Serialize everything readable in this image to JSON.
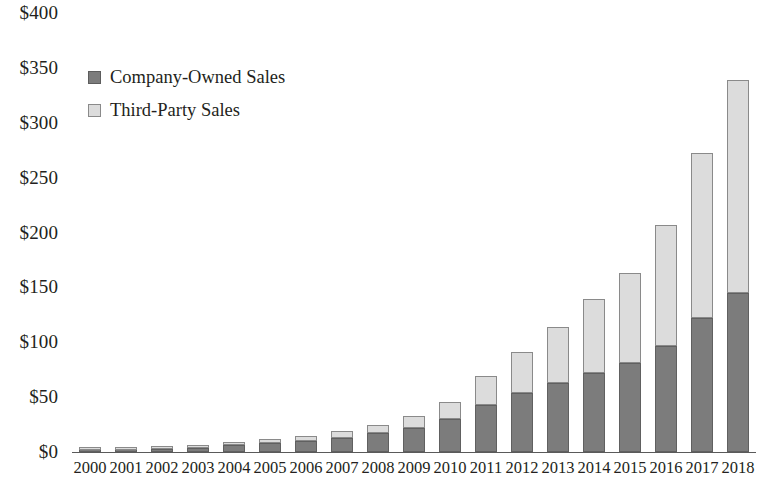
{
  "chart_data": {
    "type": "bar",
    "stacked": true,
    "title": "",
    "subtitle": "",
    "xlabel": "",
    "ylabel": "",
    "ylim": [
      0,
      400
    ],
    "ytick_step": 50,
    "grid": false,
    "legend_position": "top-left",
    "value_prefix": "$",
    "categories": [
      "2000",
      "2001",
      "2002",
      "2003",
      "2004",
      "2005",
      "2006",
      "2007",
      "2008",
      "2009",
      "2010",
      "2011",
      "2012",
      "2013",
      "2014",
      "2015",
      "2016",
      "2017",
      "2018"
    ],
    "ytick_labels": [
      "$0",
      "$50",
      "$100",
      "$150",
      "$200",
      "$250",
      "$300",
      "$350",
      "$400"
    ],
    "ytick_values": [
      0,
      50,
      100,
      150,
      200,
      250,
      300,
      350,
      400
    ],
    "series": [
      {
        "name": "Company-Owned Sales",
        "color": "#7c7c7c",
        "values": [
          2,
          2,
          3,
          4,
          6,
          8,
          10,
          13,
          17,
          22,
          30,
          43,
          54,
          63,
          72,
          81,
          97,
          122,
          145
        ]
      },
      {
        "name": "Third-Party Sales",
        "color": "#dcdcdc",
        "values": [
          1,
          1,
          2,
          2,
          3,
          4,
          5,
          6,
          8,
          11,
          16,
          26,
          37,
          51,
          67,
          82,
          110,
          150,
          194
        ]
      }
    ],
    "totals": [
      3,
      3,
      5,
      6,
      9,
      12,
      15,
      19,
      25,
      33,
      46,
      69,
      91,
      114,
      139,
      163,
      207,
      272,
      339
    ]
  },
  "legend": {
    "items": [
      {
        "label": "Company-Owned Sales",
        "swatch_class": "company"
      },
      {
        "label": "Third-Party Sales",
        "swatch_class": "thirdparty"
      }
    ]
  }
}
